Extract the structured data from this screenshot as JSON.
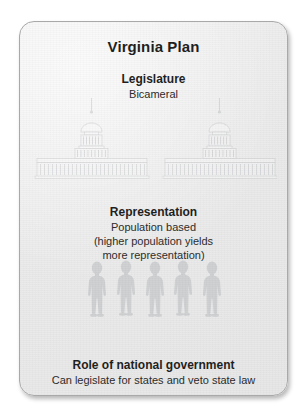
{
  "card": {
    "title": "Virginia Plan",
    "background_color": "#eaeaea",
    "border_color": "#a9a9a9",
    "text_color": "#1d1d1d"
  },
  "sections": [
    {
      "id": "legislature",
      "heading": "Legislature",
      "body": "Bicameral",
      "illustration": "capitol-building-pair-icon"
    },
    {
      "id": "representation",
      "heading": "Representation",
      "body_lines": [
        "Population based",
        "(higher population yields",
        "more representation)"
      ],
      "illustration": "people-group-icon"
    },
    {
      "id": "role",
      "heading": "Role of national government",
      "body": "Can legislate for states and veto state law",
      "illustration": null
    }
  ]
}
